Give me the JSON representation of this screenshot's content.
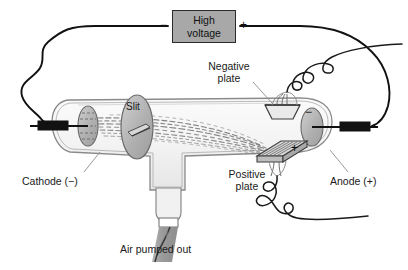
{
  "figure": {
    "background_color": "#ffffff"
  },
  "power_supply": {
    "label_line1": "High",
    "label_line2": "voltage",
    "box_fill": "#a8a8a8",
    "box_stroke": "#2b2b2b",
    "terminal_negative": "−",
    "terminal_positive": "+"
  },
  "labels": {
    "negative_plate_line1": "Negative",
    "negative_plate_line2": "plate",
    "positive_plate_line1": "Positive",
    "positive_plate_line2": "plate",
    "cathode": "Cathode (−)",
    "anode": "Anode (+)",
    "slit": "Slit",
    "air_pumped_out": "Air pumped out"
  },
  "signs": {
    "negative_plate_sign": "−",
    "positive_plate_sign": "+"
  },
  "colors": {
    "wire": "#111111",
    "glass_stroke": "#8a8a8a",
    "glass_fill": "#f2f2f2",
    "electrode_fill": "#b5b5b5",
    "electrode_stroke": "#555555",
    "plate_fill": "#e0e0e0",
    "plate_stroke": "#444444",
    "hose_fill": "#9a9a9a",
    "beam_color": "#6f6f6f",
    "leader_line": "#8f8f8f",
    "text": "#1a1a1a"
  }
}
